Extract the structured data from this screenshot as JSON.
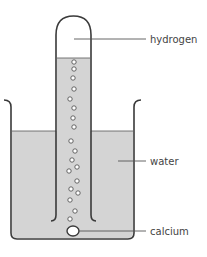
{
  "diagram": {
    "labels": {
      "hydrogen": "hydrogen",
      "water": "water",
      "calcium": "calcium"
    },
    "colors": {
      "outline": "#3a3a3a",
      "water_fill": "#d4d4d4",
      "gas_fill": "#ffffff",
      "bubble_fill": "#ffffff",
      "label_text": "#444444",
      "leader_line": "#555555"
    },
    "bubble_count": 21
  }
}
